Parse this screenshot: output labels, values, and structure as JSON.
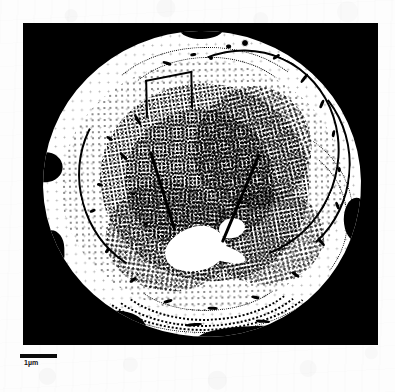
{
  "figure": {
    "kind": "sem-micrograph",
    "caption_text": "",
    "panel": {
      "background_color": "#000000",
      "x": 23,
      "y": 23,
      "width": 355,
      "height": 322
    },
    "subject": {
      "description": "roughly spherical particle, binarized high-contrast scan",
      "fill_color": "#ffffff",
      "texture": "dense stippled / dithered interior with concentric striations"
    }
  },
  "scale_bar": {
    "label": "1µm",
    "bar_color": "#0a0a0a",
    "bar_length_px": 37
  },
  "colors": {
    "page_background": "#fdfdfd",
    "panel_background": "#000000",
    "particle": "#ffffff",
    "ink": "#000000"
  }
}
